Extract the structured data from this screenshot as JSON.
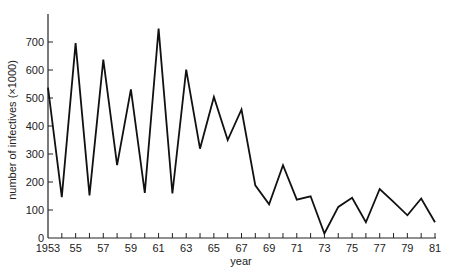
{
  "chart_data": {
    "type": "line",
    "title": "",
    "xlabel": "year",
    "ylabel": "number of infectives (×1000)",
    "xlim": [
      1953,
      1981
    ],
    "ylim": [
      0,
      800
    ],
    "grid": false,
    "legend": null,
    "x_tick_labels": [
      {
        "year": 1953,
        "label": "1953"
      },
      {
        "year": 1955,
        "label": "55"
      },
      {
        "year": 1957,
        "label": "57"
      },
      {
        "year": 1959,
        "label": "59"
      },
      {
        "year": 1961,
        "label": "61"
      },
      {
        "year": 1963,
        "label": "63"
      },
      {
        "year": 1965,
        "label": "65"
      },
      {
        "year": 1967,
        "label": "67"
      },
      {
        "year": 1969,
        "label": "69"
      },
      {
        "year": 1971,
        "label": "71"
      },
      {
        "year": 1973,
        "label": "73"
      },
      {
        "year": 1975,
        "label": "75"
      },
      {
        "year": 1977,
        "label": "77"
      },
      {
        "year": 1979,
        "label": "79"
      },
      {
        "year": 1981,
        "label": "81"
      }
    ],
    "y_ticks": [
      0,
      100,
      200,
      300,
      400,
      500,
      600,
      700
    ],
    "x": [
      1953,
      1954,
      1955,
      1956,
      1957,
      1958,
      1959,
      1960,
      1961,
      1962,
      1963,
      1964,
      1965,
      1966,
      1967,
      1968,
      1969,
      1970,
      1971,
      1972,
      1973,
      1974,
      1975,
      1976,
      1977,
      1978,
      1979,
      1980,
      1981
    ],
    "series": [
      {
        "name": "infectives",
        "color": "#111111",
        "values": [
          537,
          146,
          696,
          152,
          637,
          260,
          531,
          161,
          748,
          159,
          601,
          319,
          504,
          350,
          459,
          188,
          120,
          260,
          137,
          149,
          16,
          111,
          144,
          56,
          175,
          129,
          81,
          141,
          56
        ]
      }
    ]
  }
}
